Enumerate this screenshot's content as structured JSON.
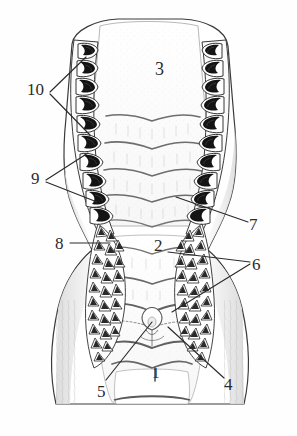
{
  "figure": {
    "type": "anatomical-line-drawing",
    "view": "ventral",
    "background_color": "#ffffff",
    "ink_color": "#2b2b2b",
    "shade_color": "#8e8e8e",
    "tooth_fill_color": "#1a1a1a"
  },
  "labels": [
    {
      "id": "l1",
      "text": "1",
      "x": 152,
      "y": 366,
      "size": 15,
      "name": "callout-1"
    },
    {
      "id": "l2",
      "text": "2",
      "x": 154,
      "y": 237,
      "size": 17,
      "name": "callout-2"
    },
    {
      "id": "l3",
      "text": "3",
      "x": 155,
      "y": 60,
      "size": 18,
      "name": "callout-3"
    },
    {
      "id": "l4",
      "text": "4",
      "x": 224,
      "y": 376,
      "size": 17,
      "name": "callout-4"
    },
    {
      "id": "l5",
      "text": "5",
      "x": 97,
      "y": 383,
      "size": 17,
      "name": "callout-5"
    },
    {
      "id": "l6",
      "text": "6",
      "x": 252,
      "y": 256,
      "size": 17,
      "name": "callout-6"
    },
    {
      "id": "l7",
      "text": "7",
      "x": 249,
      "y": 216,
      "size": 17,
      "name": "callout-7"
    },
    {
      "id": "l8",
      "text": "8",
      "x": 55,
      "y": 235,
      "size": 17,
      "name": "callout-8"
    },
    {
      "id": "l9",
      "text": "9",
      "x": 31,
      "y": 170,
      "size": 17,
      "name": "callout-9"
    },
    {
      "id": "l10",
      "text": "10",
      "x": 27,
      "y": 81,
      "size": 17,
      "name": "callout-10"
    }
  ],
  "leader_lines": [
    {
      "name": "leader-10-upper",
      "from": [
        50,
        92
      ],
      "to": [
        86,
        57
      ]
    },
    {
      "name": "leader-10-lower",
      "from": [
        50,
        94
      ],
      "to": [
        90,
        135
      ]
    },
    {
      "name": "leader-9-upper",
      "from": [
        46,
        180
      ],
      "to": [
        88,
        153
      ]
    },
    {
      "name": "leader-9-lower",
      "from": [
        46,
        182
      ],
      "to": [
        97,
        202
      ]
    },
    {
      "name": "leader-8",
      "from": [
        70,
        243
      ],
      "to": [
        110,
        243
      ]
    },
    {
      "name": "leader-7",
      "from": [
        248,
        222
      ],
      "to": [
        176,
        197
      ]
    },
    {
      "name": "leader-6-upper",
      "from": [
        250,
        262
      ],
      "to": [
        168,
        252
      ]
    },
    {
      "name": "leader-6-lower",
      "from": [
        250,
        264
      ],
      "to": [
        172,
        312
      ]
    },
    {
      "name": "leader-5",
      "from": [
        106,
        380
      ],
      "to": [
        152,
        322
      ]
    },
    {
      "name": "leader-4",
      "from": [
        224,
        378
      ],
      "to": [
        168,
        327
      ]
    },
    {
      "name": "tick-1",
      "from": [
        155,
        368
      ],
      "to": [
        155,
        381
      ]
    }
  ],
  "features": {
    "upper_palate_region": "3",
    "left_tooth_row_label": "10 / 9",
    "right_tooth_row_label": "7",
    "papillate_pad_left_label": "8",
    "papillate_pad_right_label": "6",
    "midline_structures": "4 / 5",
    "lower_plate": "1",
    "mid_plate": "2"
  },
  "counts": {
    "left_teeth": 10,
    "right_teeth": 10,
    "transverse_ridges_upper": 5,
    "transverse_ridges_lower": 5,
    "papilla_rows_left": 13,
    "papilla_rows_right": 13
  }
}
